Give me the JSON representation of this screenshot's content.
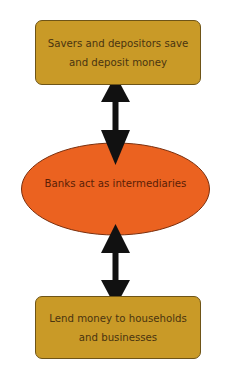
{
  "diagram": {
    "top_box": {
      "line1": "Savers and depositors save",
      "line2": "and deposit money",
      "fill": "#c99a27"
    },
    "center_ellipse": {
      "label": "Banks act as intermediaries",
      "fill": "#eb6220"
    },
    "bottom_box": {
      "line1": "Lend money to households",
      "line2": "and businesses",
      "fill": "#c99a27"
    },
    "connectors": [
      {
        "from": "top_box",
        "to": "center_ellipse",
        "type": "double-headed-arrow"
      },
      {
        "from": "center_ellipse",
        "to": "bottom_box",
        "type": "double-headed-arrow"
      }
    ]
  }
}
